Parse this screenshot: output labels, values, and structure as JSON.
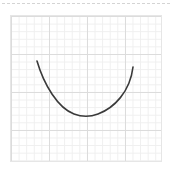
{
  "canvas": {
    "width": 172,
    "height": 171,
    "background": "#ffffff"
  },
  "top_border": {
    "style": "dashed",
    "color": "#d4d4d4"
  },
  "grid": {
    "major_color": "#dcdcdc",
    "minor_color": "#efefef",
    "major_divisions_x": 4,
    "major_divisions_y": 4,
    "minor_per_major": 5
  },
  "curve": {
    "shape": "u-shaped-parabola",
    "stroke_color": "#3a3a3a",
    "stroke_width": 1.6,
    "points": [
      [
        37,
        61
      ],
      [
        42,
        75
      ],
      [
        55,
        100
      ],
      [
        70,
        113
      ],
      [
        84,
        116
      ],
      [
        100,
        113
      ],
      [
        112,
        108
      ],
      [
        125,
        95
      ],
      [
        133,
        67
      ]
    ]
  }
}
